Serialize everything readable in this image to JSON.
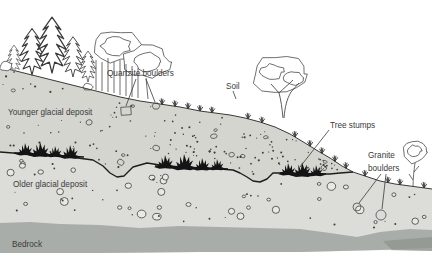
{
  "diagram": {
    "labels": {
      "quartzite_boulders": "Quartzite boulders",
      "soil": "Soil",
      "younger_deposit": "Younger glacial deposit",
      "tree_stumps": "Tree stumps",
      "granite_line1": "Granite",
      "granite_line2": "boulders",
      "older_deposit": "Older glacial deposit",
      "bedrock": "Bedrock"
    },
    "colors": {
      "background": "#ffffff",
      "younger_deposit_fill": "#d5d5d0",
      "older_deposit_fill": "#dcdcd8",
      "bedrock_fill": "#a9ada9",
      "page_shadow": "#90948e",
      "stump_fill": "#141414",
      "label_text": "#3a3a3a"
    }
  }
}
